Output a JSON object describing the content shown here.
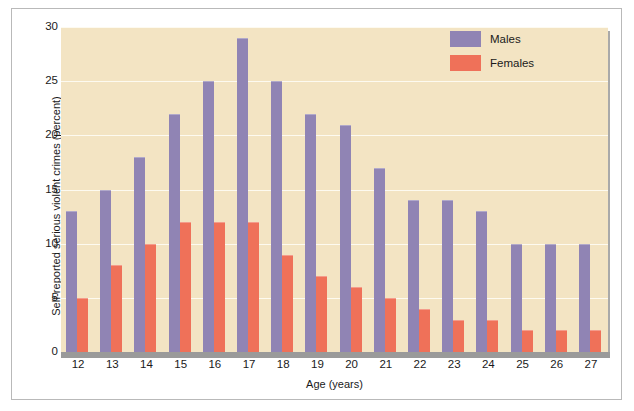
{
  "chart_data": {
    "type": "bar",
    "title": "",
    "xlabel": "Age (years)",
    "ylabel": "Self-reported serious violent crimes (percent)",
    "categories": [
      "12",
      "13",
      "14",
      "15",
      "16",
      "17",
      "18",
      "19",
      "20",
      "21",
      "22",
      "23",
      "24",
      "25",
      "26",
      "27"
    ],
    "series": [
      {
        "name": "Males",
        "color": "#9084b4",
        "values": [
          13,
          15,
          18,
          22,
          25,
          29,
          25,
          22,
          21,
          17,
          14,
          14,
          13,
          10,
          10,
          10
        ]
      },
      {
        "name": "Females",
        "color": "#ef7159",
        "values": [
          5,
          8,
          10,
          12,
          12,
          12,
          9,
          7,
          6,
          5,
          4,
          3,
          3,
          2,
          2,
          2
        ]
      }
    ],
    "ylim": [
      0,
      30
    ],
    "yticks": [
      "0",
      "5",
      "10",
      "15",
      "20",
      "25",
      "30"
    ],
    "ytick_values": [
      0,
      5,
      10,
      15,
      20,
      25,
      30
    ],
    "grid": true,
    "legend_position": "top-right",
    "plot_background": "#f3e4c3",
    "page_background": "#ffffff"
  }
}
